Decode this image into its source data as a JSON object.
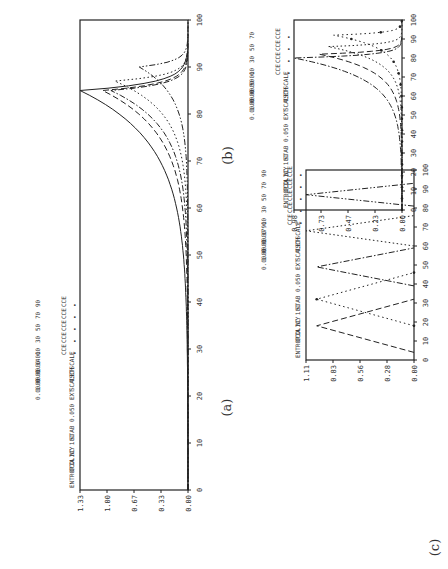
{
  "chart_data": [
    {
      "id": "a",
      "type": "line",
      "caption": "(a)",
      "orientation": "rotated -90deg",
      "x_ticks": [
        "0",
        "10",
        "20",
        "30",
        "40",
        "50",
        "60",
        "70",
        "80",
        "90",
        "100"
      ],
      "xlim": [
        0,
        100
      ],
      "y_ticks": [
        "0.00",
        "0.33",
        "0.67",
        "1.00",
        "1.33"
      ],
      "ylim": [
        0,
        1.33
      ],
      "legend_header": [
        "ENTROPIA",
        "CCOLICY",
        "NC  101",
        "STAB  0.050"
      ],
      "legend_params": [
        [
          "EXT",
          "0.0000"
        ],
        [
          "SCALE",
          "1.0000"
        ],
        [
          "TSCH",
          "0.0000"
        ],
        [
          "TSCALE",
          "1.1400"
        ]
      ],
      "legend_entries": [
        {
          "marker": "•",
          "label": "CCE",
          "value": "10"
        },
        {
          "marker": "•",
          "label": "CCE",
          "value": "30"
        },
        {
          "marker": "•",
          "label": "CCE",
          "value": "50"
        },
        {
          "marker": "•",
          "label": "CCE",
          "value": "70"
        },
        {
          "marker": "•",
          "label": "CCE",
          "value": "90"
        }
      ],
      "series": [
        {
          "name": "CCE 10",
          "style": "solid",
          "peak_x": 85,
          "peak_y": 1.33,
          "shape": "rise"
        },
        {
          "name": "CCE 30",
          "style": "dash",
          "peak_x": 85,
          "peak_y": 1.05,
          "shape": "rise"
        },
        {
          "name": "CCE 50",
          "style": "dashdot",
          "peak_x": 85,
          "peak_y": 0.95,
          "shape": "rise"
        },
        {
          "name": "CCE 70",
          "style": "dot",
          "peak_x": 87,
          "peak_y": 0.9,
          "shape": "rise"
        },
        {
          "name": "CCE 90",
          "style": "dashdotdot",
          "peak_x": 90,
          "peak_y": 0.6,
          "shape": "rise"
        }
      ]
    },
    {
      "id": "b",
      "type": "line",
      "caption": "(b)",
      "orientation": "rotated -90deg",
      "x_ticks": [
        "0",
        "10",
        "20",
        "30",
        "40",
        "50",
        "60",
        "70",
        "80",
        "90",
        "100"
      ],
      "xlim": [
        0,
        100
      ],
      "y_ticks": [
        "0.00",
        "0.23",
        "0.47",
        "0.73",
        "0.98"
      ],
      "ylim": [
        0,
        0.98
      ],
      "legend_header": [
        "ENTROPIA",
        "CCOLICY",
        "NC  101",
        "STAB  0.050"
      ],
      "legend_params": [
        [
          "EXT",
          "0.0000"
        ],
        [
          "SCALE",
          "1.0000"
        ],
        [
          "TSCH",
          "0.0000"
        ],
        [
          "TSCALE",
          "0.5000"
        ]
      ],
      "legend_entries": [
        {
          "marker": "•",
          "label": "CCE",
          "value": "10"
        },
        {
          "marker": "•",
          "label": "CCE",
          "value": "30"
        },
        {
          "marker": "•",
          "label": "CCE",
          "value": "50"
        },
        {
          "marker": "•",
          "label": "CCE",
          "value": "70"
        }
      ],
      "series": [
        {
          "name": "CCE 10",
          "style": "dashdot",
          "peak_x": 80,
          "peak_y": 0.98,
          "shape": "rise"
        },
        {
          "name": "CCE 30",
          "style": "dash",
          "peak_x": 82,
          "peak_y": 0.75,
          "shape": "rise"
        },
        {
          "name": "CCE 50",
          "style": "dot",
          "peak_x": 86,
          "peak_y": 0.67,
          "shape": "rise"
        },
        {
          "name": "CCE 70",
          "style": "dotmark",
          "peak_x": 92,
          "peak_y": 0.62,
          "shape": "rise"
        }
      ]
    },
    {
      "id": "c",
      "type": "line",
      "caption": "(c)",
      "orientation": "rotated -90deg",
      "x_ticks": [
        "0",
        "10",
        "20",
        "30",
        "40",
        "50",
        "60",
        "70",
        "80",
        "90",
        "100"
      ],
      "xlim": [
        0,
        100
      ],
      "y_ticks": [
        "0.00",
        "0.28",
        "0.56",
        "0.83",
        "1.11"
      ],
      "ylim": [
        0,
        1.11
      ],
      "legend_header": [
        "ENTROPIA",
        "CCOLICY",
        "NC  101",
        "STAB  0.050"
      ],
      "legend_params": [
        [
          "EXT",
          "0.0000"
        ],
        [
          "SCALE",
          "1.0000"
        ],
        [
          "TSCH",
          "0.0000"
        ],
        [
          "TSCALE",
          "1.1790"
        ]
      ],
      "legend_entries": [
        {
          "marker": "•",
          "label": "CCE",
          "value": "10"
        },
        {
          "marker": "•",
          "label": "CCE",
          "value": "30"
        },
        {
          "marker": "•",
          "label": "CCE",
          "value": "50"
        },
        {
          "marker": "•",
          "label": "CCE",
          "value": "70"
        },
        {
          "marker": "•",
          "label": "CCE",
          "value": "90"
        }
      ],
      "series": [
        {
          "name": "CCE 10",
          "style": "dash",
          "peak_x": 18,
          "peak_y": 1.0,
          "width": 14,
          "shape": "tri"
        },
        {
          "name": "CCE 30",
          "style": "dotmark",
          "peak_x": 32,
          "peak_y": 1.0,
          "width": 14,
          "shape": "tri"
        },
        {
          "name": "CCE 50",
          "style": "dashdot",
          "peak_x": 49,
          "peak_y": 1.0,
          "width": 10,
          "shape": "tri"
        },
        {
          "name": "CCE 70",
          "style": "dot",
          "peak_x": 68,
          "peak_y": 1.11,
          "width": 8,
          "shape": "tri"
        },
        {
          "name": "CCE 90",
          "style": "dashdotdot",
          "peak_x": 87,
          "peak_y": 1.11,
          "width": 6,
          "shape": "tri"
        }
      ]
    }
  ]
}
